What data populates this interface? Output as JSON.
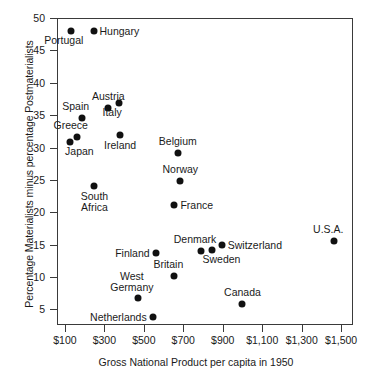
{
  "chart_data": {
    "type": "scatter",
    "title": "",
    "xlabel": "Gross National Product per capita in 1950",
    "ylabel": "Percentage Materialists minus percentage Postmaterialists",
    "xlim": [
      60,
      1560
    ],
    "ylim": [
      2.6,
      50
    ],
    "grid": false,
    "legend": "none",
    "xticks": [
      {
        "value": 100,
        "label": "$100"
      },
      {
        "value": 300,
        "label": "$300"
      },
      {
        "value": 500,
        "label": "$500"
      },
      {
        "value": 700,
        "label": "$700"
      },
      {
        "value": 900,
        "label": "$900"
      },
      {
        "value": 1100,
        "label": "$1,100"
      },
      {
        "value": 1300,
        "label": "$1,300"
      },
      {
        "value": 1500,
        "label": "$1,500"
      }
    ],
    "yticks": [
      {
        "value": 5,
        "label": "5"
      },
      {
        "value": 10,
        "label": "10"
      },
      {
        "value": 15,
        "label": "15"
      },
      {
        "value": 20,
        "label": "20"
      },
      {
        "value": 25,
        "label": "25"
      },
      {
        "value": 30,
        "label": "30"
      },
      {
        "value": 35,
        "label": "35"
      },
      {
        "value": 40,
        "label": "40"
      },
      {
        "value": 45,
        "label": "45"
      },
      {
        "value": 50,
        "label": "50"
      }
    ],
    "marker_color": "#111111",
    "points": [
      {
        "name": "Portugal",
        "x": 130,
        "y": 48.0,
        "label": "Portugal",
        "pos": "below-left"
      },
      {
        "name": "Hungary",
        "x": 245,
        "y": 48.0,
        "label": "Hungary",
        "pos": "right"
      },
      {
        "name": "Austria",
        "x": 320,
        "y": 36.1,
        "label": "Austria",
        "pos": "above"
      },
      {
        "name": "Italy",
        "x": 375,
        "y": 36.9,
        "label": "Italy",
        "pos": "below-left"
      },
      {
        "name": "Spain",
        "x": 185,
        "y": 34.6,
        "label": "Spain",
        "pos": "above-left"
      },
      {
        "name": "Greece",
        "x": 160,
        "y": 31.7,
        "label": "Greece",
        "pos": "above-left"
      },
      {
        "name": "Japan",
        "x": 128,
        "y": 30.9,
        "label": "Japan",
        "pos": "below-right"
      },
      {
        "name": "Ireland",
        "x": 380,
        "y": 32.0,
        "label": "Ireland",
        "pos": "below"
      },
      {
        "name": "Belgium",
        "x": 672,
        "y": 29.2,
        "label": "Belgium",
        "pos": "above"
      },
      {
        "name": "Norway",
        "x": 685,
        "y": 24.8,
        "label": "Norway",
        "pos": "above"
      },
      {
        "name": "France",
        "x": 655,
        "y": 21.2,
        "label": "France",
        "pos": "right"
      },
      {
        "name": "South Africa",
        "x": 250,
        "y": 24.0,
        "label": "South\nAfrica",
        "pos": "below"
      },
      {
        "name": "Denmark",
        "x": 790,
        "y": 14.0,
        "label": "Denmark",
        "pos": "above-left"
      },
      {
        "name": "Sweden",
        "x": 848,
        "y": 14.2,
        "label": "Sweden",
        "pos": "below-right"
      },
      {
        "name": "Switzerland",
        "x": 895,
        "y": 15.0,
        "label": "Switzerland",
        "pos": "right"
      },
      {
        "name": "Finland",
        "x": 560,
        "y": 13.7,
        "label": "Finland",
        "pos": "left"
      },
      {
        "name": "Britain",
        "x": 655,
        "y": 10.2,
        "label": "Britain",
        "pos": "above-left"
      },
      {
        "name": "West Germany",
        "x": 470,
        "y": 6.7,
        "label": "West\nGermany",
        "pos": "above-left"
      },
      {
        "name": "Netherlands",
        "x": 545,
        "y": 3.9,
        "label": "Netherlands",
        "pos": "left"
      },
      {
        "name": "Canada",
        "x": 1000,
        "y": 5.9,
        "label": "Canada",
        "pos": "above"
      },
      {
        "name": "U.S.A.",
        "x": 1465,
        "y": 15.6,
        "label": "U.S.A.",
        "pos": "above-left"
      }
    ]
  }
}
